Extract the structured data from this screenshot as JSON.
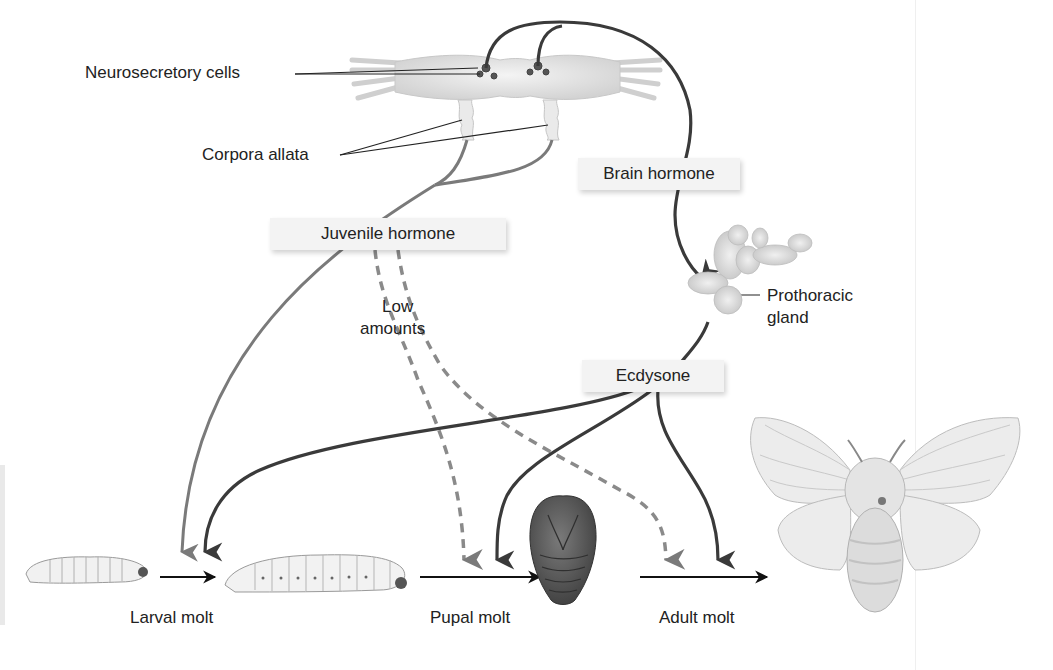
{
  "diagram": {
    "labels": {
      "neurosecretory_cells": "Neurosecretory cells",
      "corpora_allata": "Corpora allata",
      "brain_hormone": "Brain hormone",
      "juvenile_hormone": "Juvenile hormone",
      "low_amounts_line1": "Low",
      "low_amounts_line2": "amounts",
      "prothoracic_line1": "Prothoracic",
      "prothoracic_line2": "gland",
      "ecdysone": "Ecdysone",
      "larval_molt": "Larval molt",
      "pupal_molt": "Pupal molt",
      "adult_molt": "Adult molt"
    },
    "stages": [
      "young larva",
      "older larva",
      "pupa",
      "adult moth"
    ],
    "colors": {
      "dark_arrow": "#3a3a3a",
      "gray_arrow": "#7a7a7a",
      "dashed_arrow": "#8a8a8a",
      "label_box": "#f3f3f3"
    }
  }
}
